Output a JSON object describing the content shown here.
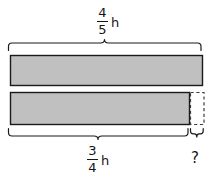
{
  "figure": {
    "type": "bar-model-diagram",
    "background_color": "#ffffff",
    "bar_fill_color": "#c0c0c0",
    "bar_stroke_color": "#1a1a1a",
    "brace_color": "#1a1a1a",
    "dashed_stroke_color": "#4d4d4d"
  },
  "top_measure": {
    "numerator": "4",
    "denominator": "5",
    "unit": "h",
    "full_text": "4/5 h"
  },
  "bottom_measure": {
    "numerator": "3",
    "denominator": "4",
    "unit": "h",
    "full_text": "3/4 h"
  },
  "unknown_measure": {
    "label": "?"
  },
  "bars": [
    {
      "name": "top-bar",
      "x": 10,
      "y": 55,
      "width": 193,
      "height": 31,
      "fill": "#c0c0c0",
      "style": "solid"
    },
    {
      "name": "bottom-bar-filled",
      "x": 10,
      "y": 92,
      "width": 180,
      "height": 33,
      "fill": "#c0c0c0",
      "style": "solid"
    },
    {
      "name": "bottom-bar-remainder",
      "x": 190,
      "y": 92,
      "width": 14,
      "height": 33,
      "fill": "none",
      "style": "dashed"
    }
  ],
  "braces": [
    {
      "name": "top-brace",
      "orientation": "up",
      "x_start": 8,
      "x_end": 203,
      "y": 50,
      "measures": "top-bar"
    },
    {
      "name": "bottom-brace-main",
      "orientation": "down",
      "x_start": 8,
      "x_end": 188,
      "y": 129,
      "measures": "bottom-bar-filled"
    },
    {
      "name": "bottom-brace-unknown",
      "orientation": "down",
      "x_start": 190,
      "x_end": 204,
      "y": 129,
      "measures": "bottom-bar-remainder"
    }
  ]
}
